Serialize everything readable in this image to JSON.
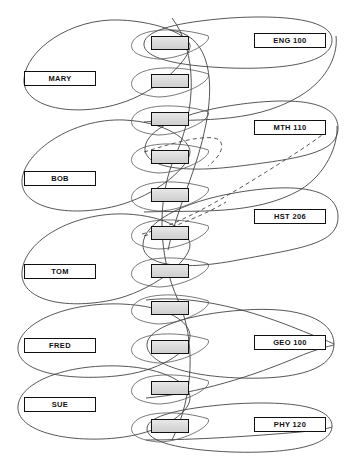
{
  "diagram": {
    "type": "network-model-occurrence-diagram",
    "canvas": {
      "width": 345,
      "height": 462,
      "background": "#ffffff"
    },
    "colors": {
      "line": "#333333",
      "record_fill": "#dcdcdc",
      "label_fill": "#ffffff",
      "text": "#111111"
    },
    "owners": [
      {
        "id": "mary",
        "label": "MARY",
        "x": 24,
        "y": 71,
        "ellipse": {
          "cx": 118,
          "cy": 78,
          "rx": 100,
          "ry": 40
        }
      },
      {
        "id": "bob",
        "label": "BOB",
        "x": 24,
        "y": 171,
        "ellipse": {
          "cx": 118,
          "cy": 178,
          "rx": 100,
          "ry": 40
        }
      },
      {
        "id": "tom",
        "label": "TOM",
        "x": 24,
        "y": 264,
        "ellipse": {
          "cx": 118,
          "cy": 271,
          "rx": 100,
          "ry": 42
        }
      },
      {
        "id": "fred",
        "label": "FRED",
        "x": 24,
        "y": 338,
        "ellipse": {
          "cx": 118,
          "cy": 345,
          "rx": 100,
          "ry": 32
        }
      },
      {
        "id": "sue",
        "label": "SUE",
        "x": 24,
        "y": 397,
        "ellipse": {
          "cx": 118,
          "cy": 404,
          "rx": 100,
          "ry": 32
        }
      }
    ],
    "members": [
      {
        "id": "course-eng100",
        "label": "ENG 100",
        "x": 254,
        "y": 33,
        "ellipse": {
          "cx": 222,
          "cy": 40,
          "rx": 100,
          "ry": 26
        }
      },
      {
        "id": "course-mth110",
        "label": "MTH 110",
        "x": 254,
        "y": 120,
        "ellipse": {
          "cx": 222,
          "cy": 127,
          "rx": 100,
          "ry": 34
        }
      },
      {
        "id": "course-hst206",
        "label": "HST 206",
        "x": 254,
        "y": 209,
        "ellipse": {
          "cx": 222,
          "cy": 216,
          "rx": 100,
          "ry": 34
        }
      },
      {
        "id": "course-geo100",
        "label": "GEO 100",
        "x": 254,
        "y": 335,
        "ellipse": {
          "cx": 222,
          "cy": 342,
          "rx": 100,
          "ry": 32
        }
      },
      {
        "id": "course-phy120",
        "label": "PHY 120",
        "x": 254,
        "y": 417,
        "ellipse": {
          "cx": 222,
          "cy": 424,
          "rx": 100,
          "ry": 26
        }
      }
    ],
    "records": [
      {
        "id": "record-1",
        "x": 151,
        "y": 36
      },
      {
        "id": "record-2",
        "x": 151,
        "y": 74
      },
      {
        "id": "record-3",
        "x": 151,
        "y": 112
      },
      {
        "id": "record-4",
        "x": 151,
        "y": 150
      },
      {
        "id": "record-5",
        "x": 151,
        "y": 188
      },
      {
        "id": "record-6",
        "x": 151,
        "y": 226
      },
      {
        "id": "record-7",
        "x": 151,
        "y": 264
      },
      {
        "id": "record-8",
        "x": 151,
        "y": 301
      },
      {
        "id": "record-9",
        "x": 151,
        "y": 340
      },
      {
        "id": "record-10",
        "x": 151,
        "y": 381
      },
      {
        "id": "record-11",
        "x": 151,
        "y": 419
      }
    ],
    "record_lenses": [
      {
        "id": "lens-1",
        "cx": 170,
        "cy": 43,
        "rx": 38,
        "ry": 16
      },
      {
        "id": "lens-2",
        "cx": 170,
        "cy": 81,
        "rx": 38,
        "ry": 16
      },
      {
        "id": "lens-3",
        "cx": 170,
        "cy": 119,
        "rx": 38,
        "ry": 16
      },
      {
        "id": "lens-4",
        "cx": 170,
        "cy": 157,
        "rx": 38,
        "ry": 16
      },
      {
        "id": "lens-5",
        "cx": 170,
        "cy": 195,
        "rx": 38,
        "ry": 16
      },
      {
        "id": "lens-6",
        "cx": 170,
        "cy": 233,
        "rx": 38,
        "ry": 16
      },
      {
        "id": "lens-7",
        "cx": 170,
        "cy": 271,
        "rx": 38,
        "ry": 16
      },
      {
        "id": "lens-8",
        "cx": 170,
        "cy": 308,
        "rx": 38,
        "ry": 16
      },
      {
        "id": "lens-9",
        "cx": 170,
        "cy": 347,
        "rx": 38,
        "ry": 16
      },
      {
        "id": "lens-10",
        "cx": 170,
        "cy": 388,
        "rx": 38,
        "ry": 16
      },
      {
        "id": "lens-11",
        "cx": 170,
        "cy": 426,
        "rx": 38,
        "ry": 16
      }
    ]
  }
}
